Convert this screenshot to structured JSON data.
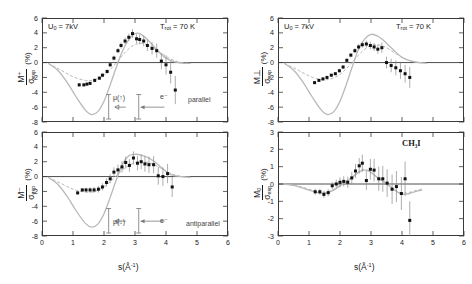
{
  "figure": {
    "molecule": "CH₃I",
    "xlabel_s": "s(",
    "xlabel_unit": "Å",
    "xlabel_exp": "-1",
    "xlabel_close": ")"
  },
  "panels": [
    {
      "id": "top-left",
      "position": "top-left",
      "ylabel_num": "M⁺",
      "ylabel_den": "σ",
      "ylabel_den_sub": "exp",
      "ylabel_pct": "(%)",
      "annotations": {
        "voltage_prefix": "U",
        "voltage_sub": "0",
        "voltage_value": "= 7kV",
        "temperature_prefix": "T",
        "temperature_sub": "rot",
        "temperature_value": "= 70 K",
        "orientation": "parallel",
        "dipole": "μ(↑)",
        "electron": "e⁻"
      }
    },
    {
      "id": "bottom-left",
      "position": "bottom-left",
      "ylabel_num": "M⁻",
      "ylabel_den": "σ",
      "ylabel_den_sub": "exp",
      "ylabel_pct": "(%)",
      "annotations": {
        "orientation": "antiparallel",
        "dipole": "μ(↓)",
        "electron": "e⁻"
      }
    },
    {
      "id": "top-right",
      "position": "top-right",
      "ylabel_num": "M⊥",
      "ylabel_den": "σ",
      "ylabel_den_sub": "exp",
      "ylabel_pct": "(%)",
      "annotations": {
        "voltage_prefix": "U",
        "voltage_sub": "0",
        "voltage_value": "= 7kV",
        "temperature_prefix": "T",
        "temperature_sub": "rot",
        "temperature_value": "= 70 K"
      }
    },
    {
      "id": "bottom-right",
      "position": "bottom-right",
      "ylabel_num": "M₀",
      "ylabel_den": "σ",
      "ylabel_den_sub": "exp",
      "ylabel_pct": "(%)",
      "annotations": {
        "molecule": "CH₃I"
      }
    }
  ],
  "chart_data": [
    {
      "type": "scatter",
      "panel": "top-left",
      "title": "",
      "xlabel": "s(Å⁻¹)",
      "ylabel": "M⁺/σ_exp (%)",
      "xlim": [
        0,
        6
      ],
      "ylim": [
        -8,
        6
      ],
      "xticks": [
        0,
        1,
        2,
        3,
        4,
        5,
        6
      ],
      "yticks": [
        6,
        4,
        2,
        0,
        -2,
        -4,
        -6,
        -8
      ],
      "grid": false,
      "legend_position": "none",
      "series": [
        {
          "name": "experiment",
          "marker": "filled-square",
          "x": [
            1.2,
            1.35,
            1.45,
            1.55,
            1.7,
            1.85,
            1.95,
            2.1,
            2.2,
            2.32,
            2.45,
            2.55,
            2.68,
            2.8,
            2.92,
            3.05,
            3.15,
            3.28,
            3.4,
            3.55,
            3.7,
            3.85,
            4.0,
            4.15,
            4.3
          ],
          "y": [
            -3.0,
            -3.0,
            -2.9,
            -2.8,
            -2.4,
            -2.1,
            -1.7,
            -1.2,
            -0.3,
            0.6,
            1.6,
            2.3,
            2.9,
            3.4,
            3.9,
            3.2,
            3.1,
            2.9,
            2.3,
            1.9,
            1.6,
            0.2,
            -0.3,
            -1.3,
            -3.7
          ],
          "yerr": [
            0.25,
            0.2,
            0.2,
            0.2,
            0.25,
            0.25,
            0.25,
            0.3,
            0.3,
            0.35,
            0.35,
            0.4,
            0.45,
            0.5,
            0.6,
            0.6,
            0.65,
            0.7,
            0.75,
            0.85,
            0.95,
            1.1,
            1.3,
            1.5,
            1.9
          ]
        },
        {
          "name": "theory-solid",
          "style": "solid-curve",
          "x": [
            0.2,
            0.5,
            0.8,
            1.1,
            1.4,
            1.6,
            1.8,
            2.0,
            2.2,
            2.4,
            2.6,
            2.8,
            3.0,
            3.2,
            3.4,
            3.6,
            3.8,
            4.0,
            4.2,
            4.4,
            4.6,
            4.8
          ],
          "y": [
            -0.1,
            -1.0,
            -2.6,
            -4.6,
            -6.4,
            -7.0,
            -6.6,
            -5.2,
            -3.0,
            -0.6,
            1.6,
            3.1,
            3.9,
            3.8,
            3.1,
            2.2,
            1.3,
            0.6,
            0.2,
            0.0,
            -0.1,
            -0.1
          ]
        },
        {
          "name": "theory-dashed",
          "style": "dashed-curve",
          "x": [
            0.2,
            0.6,
            1.0,
            1.4,
            1.7,
            2.0,
            2.3,
            2.6,
            2.9,
            3.2,
            3.5,
            3.8,
            4.1,
            4.4,
            4.7
          ],
          "y": [
            -0.1,
            -1.0,
            -1.9,
            -2.4,
            -2.3,
            -1.7,
            -0.5,
            1.0,
            2.2,
            2.6,
            2.2,
            1.4,
            0.6,
            0.1,
            -0.1
          ]
        }
      ]
    },
    {
      "type": "scatter",
      "panel": "bottom-left",
      "title": "",
      "xlabel": "s(Å⁻¹)",
      "ylabel": "M⁻/σ_exp (%)",
      "xlim": [
        0,
        6
      ],
      "ylim": [
        -8,
        6
      ],
      "xticks": [
        0,
        1,
        2,
        3,
        4,
        5,
        6
      ],
      "yticks": [
        6,
        4,
        2,
        0,
        -2,
        -4,
        -6,
        -8
      ],
      "grid": false,
      "legend_position": "none",
      "series": [
        {
          "name": "experiment",
          "marker": "filled-square",
          "x": [
            1.15,
            1.3,
            1.42,
            1.55,
            1.68,
            1.82,
            1.95,
            2.08,
            2.2,
            2.32,
            2.45,
            2.58,
            2.7,
            2.82,
            2.95,
            3.08,
            3.2,
            3.32,
            3.45,
            3.6,
            3.75,
            3.9,
            4.05,
            4.2
          ],
          "y": [
            -2.2,
            -1.8,
            -1.8,
            -1.8,
            -1.8,
            -1.7,
            -1.4,
            -0.8,
            -0.3,
            0.6,
            0.9,
            1.3,
            1.9,
            1.5,
            2.5,
            1.8,
            2.0,
            1.7,
            1.6,
            1.6,
            0.1,
            0.0,
            0.4,
            -1.4
          ]
        },
        {
          "name": "theory-solid",
          "style": "solid-curve",
          "x": [
            0.2,
            0.5,
            0.8,
            1.1,
            1.4,
            1.6,
            1.8,
            2.0,
            2.2,
            2.4,
            2.6,
            2.8,
            3.0,
            3.2,
            3.4,
            3.6,
            3.8,
            4.0,
            4.2,
            4.5,
            4.8
          ],
          "y": [
            -0.1,
            -1.0,
            -2.6,
            -4.6,
            -6.3,
            -6.8,
            -6.4,
            -5.0,
            -2.8,
            -0.4,
            1.7,
            2.8,
            3.0,
            2.9,
            2.6,
            2.1,
            1.4,
            0.7,
            0.2,
            0.0,
            -0.1
          ]
        },
        {
          "name": "theory-dashed",
          "style": "dashed-curve",
          "x": [
            0.2,
            0.6,
            1.0,
            1.4,
            1.7,
            2.0,
            2.3,
            2.6,
            2.9,
            3.2,
            3.5,
            3.8,
            4.1,
            4.4,
            4.7
          ],
          "y": [
            -0.1,
            -0.9,
            -1.7,
            -2.1,
            -2.0,
            -1.4,
            -0.3,
            0.9,
            1.7,
            2.0,
            1.8,
            1.2,
            0.5,
            0.1,
            -0.1
          ]
        }
      ]
    },
    {
      "type": "scatter",
      "panel": "top-right",
      "title": "",
      "xlabel": "s(Å⁻¹)",
      "ylabel": "M⊥/σ_exp (%)",
      "xlim": [
        0,
        6
      ],
      "ylim": [
        -8,
        6
      ],
      "xticks": [
        0,
        1,
        2,
        3,
        4,
        5,
        6
      ],
      "yticks": [
        6,
        4,
        2,
        0,
        -2,
        -4,
        -6,
        -8
      ],
      "grid": false,
      "legend_position": "none",
      "series": [
        {
          "name": "experiment",
          "marker": "filled-square",
          "x": [
            1.18,
            1.32,
            1.45,
            1.58,
            1.72,
            1.85,
            1.98,
            2.1,
            2.22,
            2.35,
            2.48,
            2.6,
            2.72,
            2.85,
            2.98,
            3.1,
            3.22,
            3.35,
            3.5,
            3.65,
            3.8,
            3.95,
            4.1,
            4.25
          ],
          "y": [
            -2.7,
            -2.4,
            -2.2,
            -2.0,
            -1.7,
            -1.5,
            -1.1,
            -0.6,
            0.3,
            1.0,
            1.6,
            2.1,
            2.4,
            2.5,
            2.3,
            2.1,
            1.8,
            2.0,
            0.0,
            -0.4,
            -0.7,
            -1.1,
            -1.5,
            -2.0
          ],
          "yerr": [
            0.2,
            0.2,
            0.2,
            0.2,
            0.2,
            0.2,
            0.25,
            0.25,
            0.3,
            0.3,
            0.35,
            0.4,
            0.4,
            0.45,
            0.5,
            0.55,
            0.6,
            0.7,
            0.8,
            0.9,
            1.0,
            1.1,
            1.2,
            1.4
          ]
        },
        {
          "name": "theory-solid",
          "style": "solid-curve",
          "x": [
            0.2,
            0.5,
            0.8,
            1.1,
            1.4,
            1.6,
            1.8,
            2.0,
            2.2,
            2.4,
            2.6,
            2.8,
            3.0,
            3.2,
            3.4,
            3.6,
            3.8,
            4.0,
            4.3,
            4.6,
            4.8
          ],
          "y": [
            -0.1,
            -1.0,
            -2.6,
            -4.6,
            -6.4,
            -7.0,
            -6.6,
            -5.2,
            -3.0,
            -0.5,
            1.8,
            3.2,
            3.8,
            3.6,
            3.0,
            2.2,
            1.4,
            0.7,
            0.2,
            0.0,
            -0.1
          ]
        },
        {
          "name": "theory-dashed",
          "style": "dashed-curve",
          "x": [
            0.2,
            0.6,
            1.0,
            1.4,
            1.7,
            2.0,
            2.3,
            2.6,
            2.9,
            3.2,
            3.5,
            3.8,
            4.1,
            4.4,
            4.7
          ],
          "y": [
            -0.1,
            -0.9,
            -1.8,
            -2.3,
            -2.2,
            -1.6,
            -0.4,
            1.0,
            2.1,
            2.4,
            2.0,
            1.2,
            0.5,
            0.1,
            -0.1
          ]
        }
      ]
    },
    {
      "type": "scatter",
      "panel": "bottom-right",
      "title": "",
      "xlabel": "s(Å⁻¹)",
      "ylabel": "M₀/σ_exp (%)",
      "xlim": [
        0,
        6
      ],
      "ylim": [
        -3,
        3
      ],
      "xticks": [
        0,
        1,
        2,
        3,
        4,
        5,
        6
      ],
      "yticks": [
        3,
        2,
        1,
        0,
        -1,
        -2,
        -3
      ],
      "grid": false,
      "legend_position": "none",
      "series": [
        {
          "name": "experiment",
          "marker": "filled-square",
          "x": [
            1.2,
            1.35,
            1.48,
            1.62,
            1.75,
            1.88,
            2.0,
            2.12,
            2.25,
            2.38,
            2.5,
            2.62,
            2.72,
            2.85,
            2.98,
            3.1,
            3.25,
            3.38,
            3.52,
            3.68,
            3.82,
            3.98,
            4.1,
            4.25
          ],
          "y": [
            -0.45,
            -0.45,
            -0.6,
            -0.5,
            -0.1,
            0.0,
            0.1,
            0.15,
            0.1,
            0.35,
            0.75,
            1.05,
            1.2,
            0.2,
            0.85,
            0.8,
            0.3,
            0.3,
            0.05,
            -0.3,
            -0.15,
            -0.55,
            0.3,
            -2.1
          ],
          "yerr": [
            0.18,
            0.18,
            0.2,
            0.2,
            0.22,
            0.25,
            0.28,
            0.3,
            0.32,
            0.35,
            0.4,
            0.45,
            0.5,
            0.55,
            0.6,
            0.65,
            0.7,
            0.75,
            0.8,
            0.85,
            0.9,
            0.95,
            1.0,
            1.1
          ]
        },
        {
          "name": "theory-solid",
          "style": "solid-curve",
          "x": [
            0.2,
            0.6,
            1.0,
            1.3,
            1.55,
            1.8,
            2.05,
            2.3,
            2.55,
            2.75,
            2.95,
            3.15,
            3.35,
            3.55,
            3.75,
            3.95,
            4.15,
            4.4,
            4.65
          ],
          "y": [
            0.0,
            -0.12,
            -0.35,
            -0.5,
            -0.52,
            -0.35,
            -0.05,
            0.25,
            0.6,
            0.8,
            0.72,
            0.45,
            0.2,
            -0.05,
            -0.35,
            -0.55,
            -0.58,
            -0.45,
            -0.35
          ]
        },
        {
          "name": "theory-dashed",
          "style": "dashed-curve",
          "x": [
            0.2,
            0.6,
            1.0,
            1.3,
            1.55,
            1.8,
            2.05,
            2.3,
            2.55,
            2.75,
            2.95,
            3.15,
            3.35,
            3.55,
            3.75,
            3.95,
            4.15,
            4.4,
            4.65
          ],
          "y": [
            0.0,
            -0.1,
            -0.3,
            -0.45,
            -0.48,
            -0.3,
            0.0,
            0.3,
            0.65,
            0.85,
            0.75,
            0.48,
            0.22,
            -0.02,
            -0.3,
            -0.5,
            -0.52,
            -0.4,
            -0.28
          ]
        }
      ]
    }
  ]
}
